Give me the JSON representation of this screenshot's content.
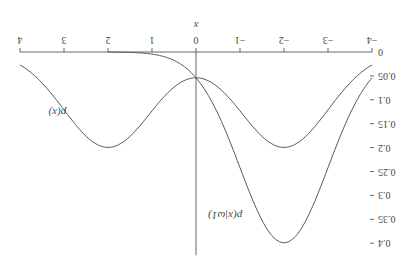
{
  "chart_data": {
    "type": "line",
    "title": "",
    "xlabel": "x",
    "ylabel": "",
    "xlim": [
      -4,
      4
    ],
    "ylim": [
      0,
      0.4
    ],
    "x_ticks": [
      "-4",
      "-3",
      "-2",
      "-1",
      "0",
      "1",
      "2",
      "3",
      "4"
    ],
    "y_ticks": [
      "0",
      "0.05",
      "0.1",
      "0.15",
      "0.2",
      "0.25",
      "0.3",
      "0.35",
      "0.4"
    ],
    "grid": false,
    "orientation_note": "figure rendered rotated 180 degrees",
    "series": [
      {
        "name": "p(x)",
        "x": [
          -4,
          -3,
          -2,
          -1,
          0,
          1,
          2,
          3,
          4
        ],
        "values": [
          0.027,
          0.121,
          0.2,
          0.121,
          0.054,
          0.121,
          0.2,
          0.121,
          0.027
        ]
      },
      {
        "name": "p(x|ω1)",
        "x": [
          -4,
          -3,
          -2,
          -1,
          0,
          1,
          2,
          3,
          4
        ],
        "values": [
          0.054,
          0.242,
          0.399,
          0.242,
          0.054,
          0.004,
          0.0001,
          0.0,
          0.0
        ]
      }
    ],
    "annotations": [
      "p(x)",
      "p(x|ω1)"
    ]
  }
}
